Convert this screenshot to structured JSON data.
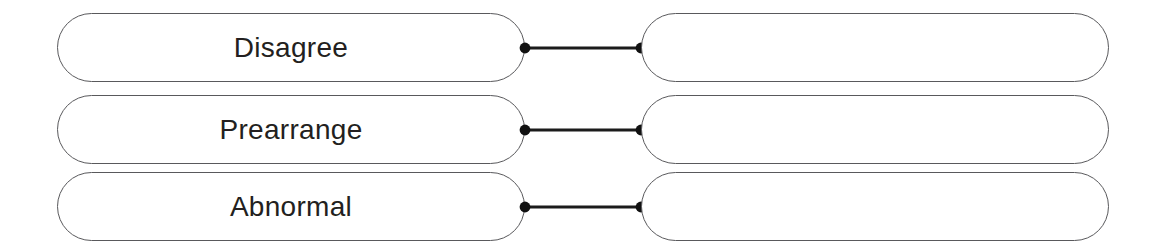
{
  "worksheet": {
    "type": "matching-exercise",
    "background_color": "#ffffff",
    "prompt_border_color": "#59595c",
    "text_color": "#231f20",
    "connector_color": "#1b1b1b",
    "rows": [
      {
        "prompt_label": "Disagree",
        "answer_label": "",
        "answer_placeholder": "",
        "connector": "line-with-dots"
      },
      {
        "prompt_label": "Prearrange",
        "answer_label": "",
        "answer_placeholder": "",
        "connector": "line-with-dots"
      },
      {
        "prompt_label": "Abnormal",
        "answer_label": "",
        "answer_placeholder": "",
        "connector": "line-with-dots"
      }
    ]
  }
}
